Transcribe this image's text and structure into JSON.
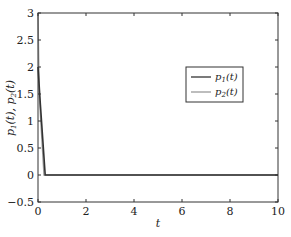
{
  "chart_data": {
    "type": "line",
    "title": "",
    "xlabel": "t",
    "ylabel": "p1(t), p2(t)",
    "xlim": [
      0,
      10
    ],
    "ylim": [
      -0.5,
      3
    ],
    "xticks": [
      0,
      2,
      4,
      6,
      8,
      10
    ],
    "yticks": [
      -0.5,
      0,
      0.5,
      1,
      1.5,
      2,
      2.5,
      3
    ],
    "xtick_labels": [
      "0",
      "2",
      "4",
      "6",
      "8",
      "10"
    ],
    "ytick_labels": [
      "−0.5",
      "0",
      "0.5",
      "1",
      "1.5",
      "2",
      "2.5",
      "3"
    ],
    "grid": false,
    "legend_position": "right-middle",
    "series": [
      {
        "name": "p1(t)",
        "color": "#333333",
        "x": [
          0,
          0.1,
          0.3,
          1,
          2,
          4,
          6,
          8,
          10
        ],
        "values": [
          2.0,
          1.3,
          0,
          0,
          0,
          0,
          0,
          0,
          0
        ]
      },
      {
        "name": "p2(t)",
        "color": "#9a9a9a",
        "x": [
          0,
          0.05,
          0.25,
          1,
          2,
          4,
          6,
          8,
          10
        ],
        "values": [
          3.0,
          1.5,
          0,
          0,
          0,
          0,
          0,
          0,
          0
        ]
      }
    ]
  },
  "legend": {
    "items": [
      {
        "label_base": "p",
        "label_sub": "1",
        "label_tail": "(t)"
      },
      {
        "label_base": "p",
        "label_sub": "2",
        "label_tail": "(t)"
      }
    ]
  },
  "axes": {
    "xlabel": "t",
    "ylabel_parts": {
      "a_base": "p",
      "a_sub": "1",
      "a_tail": "(t), ",
      "b_base": "p",
      "b_sub": "2",
      "b_tail": "(t)"
    }
  }
}
